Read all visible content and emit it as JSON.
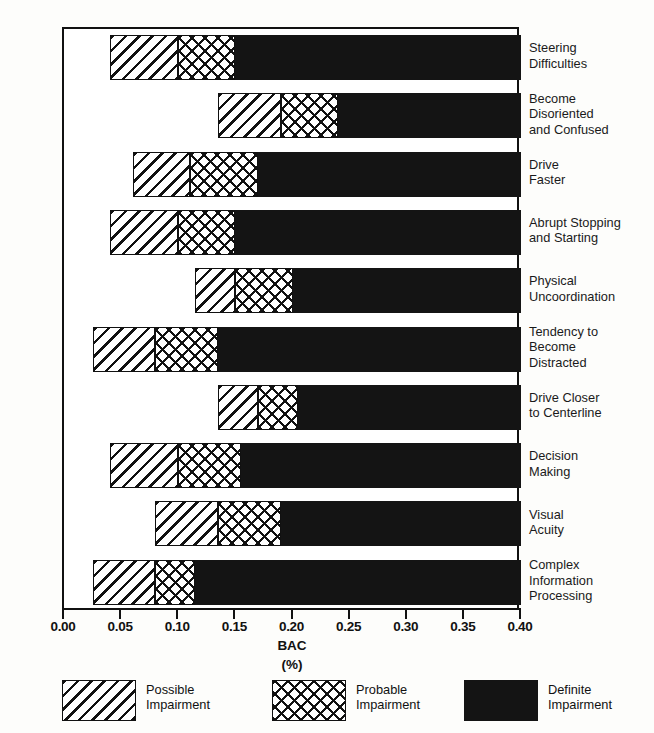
{
  "chart_data": {
    "type": "bar",
    "orientation": "horizontal",
    "title": "",
    "xlabel": "BAC",
    "xlabel_sub": "(%)",
    "ylabel": "",
    "xlim": [
      0.0,
      0.4
    ],
    "xticks": [
      0.0,
      0.05,
      0.1,
      0.15,
      0.2,
      0.25,
      0.3,
      0.35,
      0.4
    ],
    "xtick_labels": [
      "0.00",
      "0.05",
      "0.10",
      "0.15",
      "0.20",
      "0.25",
      "0.30",
      "0.35",
      "0.40"
    ],
    "grid": false,
    "legend_position": "bottom",
    "categories": [
      "Steering\nDifficulties",
      "Become\nDisoriented\nand Confused",
      "Drive\nFaster",
      "Abrupt Stopping\nand Starting",
      "Physical\nUncoordination",
      "Tendency to\nBecome\nDistracted",
      "Drive Closer\nto Centerline",
      "Decision\nMaking",
      "Visual\nAcuity",
      "Complex\nInformation\nProcessing"
    ],
    "series": [
      {
        "name": "Possible Impairment",
        "pattern": "diagonal-hatch",
        "color": "#ffffff",
        "starts": [
          0.04,
          0.135,
          0.06,
          0.04,
          0.115,
          0.025,
          0.135,
          0.04,
          0.08,
          0.025
        ],
        "ends": [
          0.1,
          0.19,
          0.11,
          0.1,
          0.15,
          0.08,
          0.17,
          0.1,
          0.135,
          0.08
        ]
      },
      {
        "name": "Probable Impairment",
        "pattern": "cross-hatch",
        "color": "#ffffff",
        "starts": [
          0.1,
          0.19,
          0.11,
          0.1,
          0.15,
          0.08,
          0.17,
          0.1,
          0.135,
          0.08
        ],
        "ends": [
          0.15,
          0.24,
          0.17,
          0.15,
          0.2,
          0.135,
          0.205,
          0.155,
          0.19,
          0.115
        ]
      },
      {
        "name": "Definite Impairment",
        "pattern": "solid-black",
        "color": "#141414",
        "starts": [
          0.15,
          0.24,
          0.17,
          0.15,
          0.2,
          0.135,
          0.205,
          0.155,
          0.19,
          0.115
        ],
        "ends": [
          0.4,
          0.4,
          0.4,
          0.4,
          0.4,
          0.4,
          0.4,
          0.4,
          0.4,
          0.4
        ]
      }
    ]
  },
  "legend": {
    "items": [
      {
        "label_line1": "Possible",
        "label_line2": "Impairment",
        "pattern": "diagonal-hatch"
      },
      {
        "label_line1": "Probable",
        "label_line2": "Impairment",
        "pattern": "cross-hatch"
      },
      {
        "label_line1": "Definite",
        "label_line2": "Impairment",
        "pattern": "solid-black"
      }
    ]
  }
}
